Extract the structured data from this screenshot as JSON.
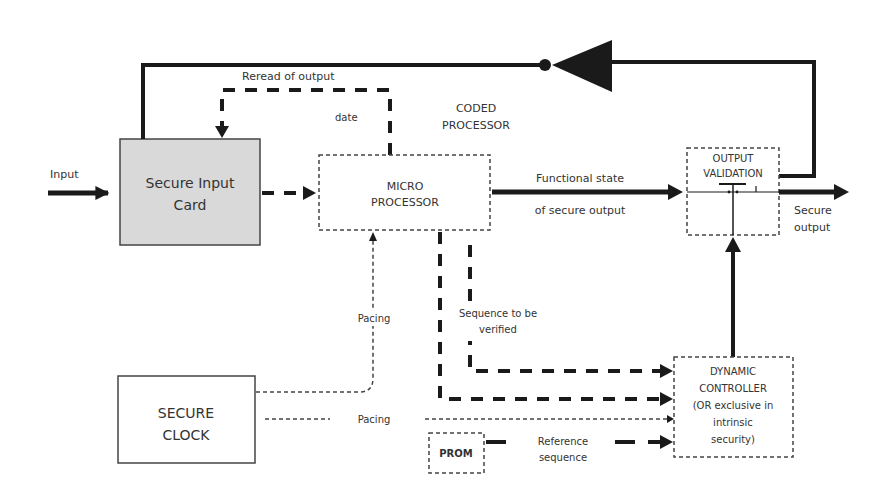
{
  "diagram": {
    "colors": {
      "line": "#1a1a1a",
      "text": "#333333",
      "input_card_fill": "#d9d9d9",
      "background": "#ffffff"
    },
    "nodes": {
      "secure_input_card": {
        "line1": "Secure Input",
        "line2": "Card"
      },
      "micro_processor": {
        "line1": "MICRO",
        "line2": "PROCESSOR"
      },
      "coded_processor": {
        "line1": "CODED",
        "line2": "PROCESSOR"
      },
      "output_validation": {
        "line1": "OUTPUT",
        "line2": "VALIDATION"
      },
      "dynamic_controller": {
        "line1": "DYNAMIC",
        "line2": "CONTROLLER",
        "line3": "(OR exclusive in",
        "line4": "intrinsic",
        "line5": "security)"
      },
      "secure_clock": {
        "line1": "SECURE",
        "line2": "CLOCK"
      },
      "prom": {
        "label": "PROM"
      }
    },
    "edges": {
      "input": "Input",
      "reread": "Reread of output",
      "date": "date",
      "functional_state_1": "Functional state",
      "functional_state_2": "of secure output",
      "secure_output_1": "Secure",
      "secure_output_2": "output",
      "pacing_vertical": "Pacing",
      "pacing_horizontal": "Pacing",
      "sequence_1": "Sequence to be",
      "sequence_2": "verified",
      "reference_1": "Reference",
      "reference_2": "sequence"
    }
  }
}
